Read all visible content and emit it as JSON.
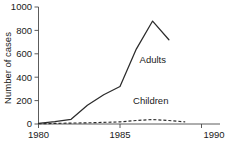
{
  "chart_data": {
    "type": "line",
    "title": "",
    "xlabel": "",
    "ylabel": "Number of cases",
    "xlim": [
      1980,
      1990
    ],
    "ylim": [
      0,
      1000
    ],
    "grid": false,
    "legend_position": "inline-annotation",
    "x_ticks": [
      "1980",
      "1985",
      "1990"
    ],
    "x_tick_values": [
      1980,
      1985,
      1990
    ],
    "y_ticks": [
      "0",
      "200",
      "400",
      "600",
      "800",
      "1000"
    ],
    "y_tick_values": [
      0,
      200,
      400,
      600,
      800,
      1000
    ],
    "series": [
      {
        "name": "Adults",
        "style": "solid",
        "color": "#2b2b2b",
        "x": [
          1980,
          1981,
          1982,
          1983,
          1984,
          1985,
          1986,
          1987,
          1988
        ],
        "values": [
          5,
          20,
          40,
          160,
          250,
          320,
          640,
          880,
          720
        ]
      },
      {
        "name": "Children",
        "style": "dashed",
        "color": "#2b2b2b",
        "x": [
          1980,
          1981,
          1982,
          1983,
          1984,
          1985,
          1986,
          1987,
          1988,
          1989
        ],
        "values": [
          2,
          5,
          8,
          10,
          14,
          18,
          30,
          38,
          30,
          18
        ]
      }
    ],
    "annotations": [
      {
        "text": "Adults",
        "x": 1986.2,
        "y": 520
      },
      {
        "text": "Children",
        "x": 1985.8,
        "y": 175
      }
    ]
  },
  "colors": {
    "background": "#ffffff",
    "axis": "#4a4a4a",
    "text": "#1a1a1a",
    "series": "#2b2b2b"
  }
}
